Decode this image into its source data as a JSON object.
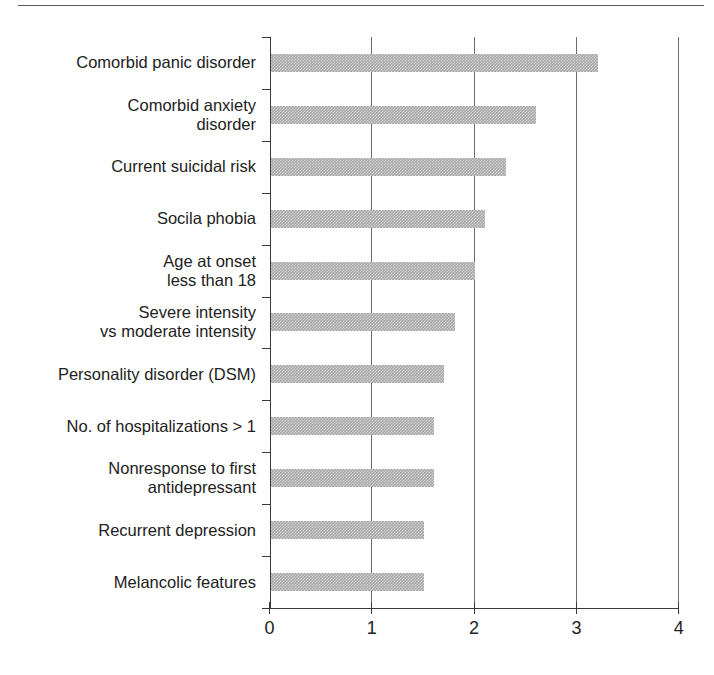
{
  "chart_data": {
    "type": "bar",
    "orientation": "horizontal",
    "title": "",
    "subtitle": "",
    "xlabel": "",
    "ylabel": "",
    "xlim": [
      0,
      4
    ],
    "xticks": [
      "0",
      "1",
      "2",
      "3",
      "4"
    ],
    "grid": "vertical",
    "legend": "none",
    "bar_color": "#a8a8a8",
    "categories": [
      "Comorbid panic disorder",
      "Comorbid anxiety\ndisorder",
      "Current suicidal risk",
      "Socila phobia",
      "Age at onset\nless than 18",
      "Severe intensity\nvs moderate intensity",
      "Personality disorder (DSM)",
      "No. of hospitalizations > 1",
      "Nonresponse to first\nantidepressant",
      "Recurrent depression",
      "Melancolic features"
    ],
    "values": [
      3.2,
      2.6,
      2.3,
      2.1,
      2.0,
      1.8,
      1.7,
      1.6,
      1.6,
      1.5,
      1.5
    ]
  }
}
